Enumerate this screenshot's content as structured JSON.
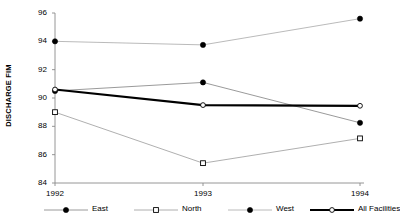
{
  "chart_data": {
    "type": "line",
    "title": "",
    "xlabel": "",
    "ylabel": "DISCHARGE FIM",
    "categories": [
      "1992",
      "1993",
      "1994"
    ],
    "ylim": [
      84,
      96
    ],
    "yticks": [
      84,
      86,
      88,
      90,
      92,
      94,
      96
    ],
    "ytick_labels": [
      "84",
      "86",
      "88",
      "90",
      "92",
      "94",
      "96"
    ],
    "grid": false,
    "legend_position": "bottom",
    "series": [
      {
        "name": "East",
        "values": [
          90.5,
          91.1,
          88.25
        ],
        "marker": "filled-circle",
        "color": "#808080",
        "line_width": 0.8
      },
      {
        "name": "North",
        "values": [
          89.0,
          85.4,
          87.15
        ],
        "marker": "open-square",
        "color": "#9a9a9a",
        "line_width": 0.8
      },
      {
        "name": "West",
        "values": [
          94.0,
          93.75,
          95.6
        ],
        "marker": "filled-circle",
        "color": "#a8a8a8",
        "line_width": 0.8
      },
      {
        "name": "All Facilities",
        "values": [
          90.6,
          89.5,
          89.45
        ],
        "marker": "open-circle",
        "color": "#000000",
        "line_width": 2.2
      }
    ]
  },
  "legend": {
    "items": [
      {
        "label": "East"
      },
      {
        "label": "North"
      },
      {
        "label": "West"
      },
      {
        "label": "All Facilities"
      }
    ]
  },
  "axes": {
    "y_title": "DISCHARGE FIM",
    "axis_color": "#8a8a8a"
  }
}
